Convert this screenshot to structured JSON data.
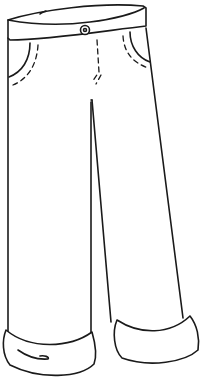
{
  "illustration": {
    "subject": "pants",
    "style": "black line art on white",
    "colors": {
      "background": "#ffffff",
      "ink": "#1a1a1a"
    },
    "parts": [
      "waistband",
      "button",
      "left-pocket",
      "right-pocket",
      "fly-stitching",
      "left-leg",
      "right-leg",
      "left-cuff",
      "right-cuff"
    ]
  }
}
